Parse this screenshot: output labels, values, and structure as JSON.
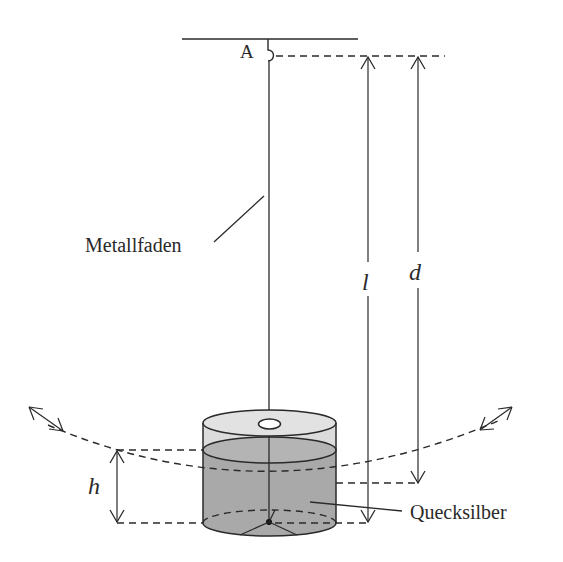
{
  "diagram": {
    "type": "physics-pendulum-schematic",
    "labels": {
      "pivot": "A",
      "thread": "Metallfaden",
      "length_l": "l",
      "distance_d": "d",
      "height_h": "h",
      "liquid": "Quecksilber"
    },
    "colors": {
      "stroke": "#2a2a2a",
      "liquid_fill": "#a9a9a9",
      "cylinder_top_fill": "#dcdcdc",
      "background": "#ffffff"
    }
  }
}
